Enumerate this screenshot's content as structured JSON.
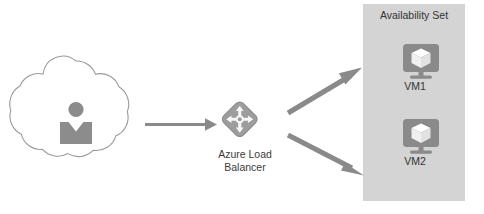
{
  "diagram": {
    "background_color": "#ffffff",
    "nodes": {
      "client_cloud": {
        "icon_name": "cloud-user-icon",
        "label": "",
        "outline_color": "#9a9a9a",
        "fill_color": "#ffffff",
        "person_color": "#8c8c8c"
      },
      "load_balancer": {
        "icon_name": "azure-load-balancer-icon",
        "label": "Azure Load\nBalancer",
        "label_line_1": "Azure Load",
        "label_line_2": "Balancer",
        "icon_color": "#8a8a8a",
        "text_color": "#3b3b3b"
      },
      "availability_set": {
        "title": "Availability Set",
        "fill_color": "#d4d4d4",
        "text_color": "#333333",
        "members": [
          {
            "label": "VM1",
            "icon_name": "virtual-machine-icon",
            "icon_color": "#8a8a8a",
            "cube_color": "#ffffff"
          },
          {
            "label": "VM2",
            "icon_name": "virtual-machine-icon",
            "icon_color": "#8a8a8a",
            "cube_color": "#ffffff"
          }
        ]
      }
    },
    "connections": [
      {
        "name": "cloud-to-load-balancer",
        "from": "client_cloud",
        "to": "load_balancer",
        "style": "thin-arrow",
        "color": "#8a8a8a"
      },
      {
        "name": "load-balancer-to-vm1",
        "from": "load_balancer",
        "to": "VM1",
        "style": "thick-arrow",
        "color": "#8a8a8a"
      },
      {
        "name": "load-balancer-to-vm2",
        "from": "load_balancer",
        "to": "VM2",
        "style": "thick-arrow",
        "color": "#8a8a8a"
      }
    ]
  }
}
